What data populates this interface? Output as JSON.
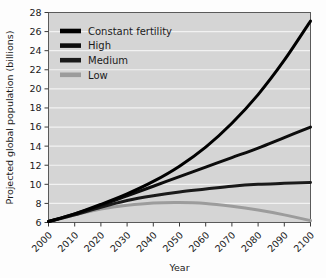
{
  "chart_data": {
    "type": "line",
    "title": "",
    "xlabel": "Year",
    "ylabel": "Projected global population (billions)",
    "xlim": [
      2000,
      2100
    ],
    "ylim": [
      6,
      28
    ],
    "xticks": [
      2000,
      2010,
      2020,
      2030,
      2040,
      2050,
      2060,
      2070,
      2080,
      2090,
      2100
    ],
    "yticks": [
      6,
      8,
      10,
      12,
      14,
      16,
      18,
      20,
      22,
      24,
      26,
      28
    ],
    "grid": true,
    "grid_color": "#f2f2f2",
    "plot_background": "#d5d5d5",
    "legend_position": "upper left",
    "x": [
      2000,
      2010,
      2020,
      2030,
      2040,
      2050,
      2060,
      2070,
      2080,
      2090,
      2100
    ],
    "series": [
      {
        "name": "Constant fertility",
        "color": "#000000",
        "width": 3.0,
        "values": [
          6.1,
          6.9,
          7.9,
          9.0,
          10.3,
          11.9,
          13.9,
          16.4,
          19.4,
          23.0,
          27.1
        ]
      },
      {
        "name": "High",
        "color": "#0d0d0d",
        "width": 3.0,
        "values": [
          6.1,
          6.9,
          7.8,
          8.8,
          9.8,
          10.8,
          11.8,
          12.8,
          13.8,
          14.9,
          16.0
        ]
      },
      {
        "name": "Medium",
        "color": "#1a1a1a",
        "width": 3.0,
        "values": [
          6.1,
          6.8,
          7.6,
          8.3,
          8.8,
          9.2,
          9.5,
          9.8,
          10.0,
          10.1,
          10.2
        ]
      },
      {
        "name": "Low",
        "color": "#9c9c9c",
        "width": 3.0,
        "values": [
          6.1,
          6.8,
          7.4,
          7.8,
          8.05,
          8.1,
          8.0,
          7.7,
          7.3,
          6.8,
          6.2
        ]
      }
    ]
  },
  "legend": {
    "items": [
      {
        "label": "Constant fertility",
        "color": "#000000"
      },
      {
        "label": "High",
        "color": "#0d0d0d"
      },
      {
        "label": "Medium",
        "color": "#1a1a1a"
      },
      {
        "label": "Low",
        "color": "#9c9c9c"
      }
    ]
  },
  "axes": {
    "y_title": "Projected global population (billions)",
    "x_title": "Year",
    "y_tick_labels": [
      "28",
      "26",
      "24",
      "22",
      "20",
      "18",
      "16",
      "14",
      "12",
      "10",
      "8",
      "6"
    ],
    "x_tick_labels": [
      "2000",
      "2010",
      "2020",
      "2030",
      "2040",
      "2050",
      "2060",
      "2070",
      "2080",
      "2090",
      "2100"
    ]
  }
}
